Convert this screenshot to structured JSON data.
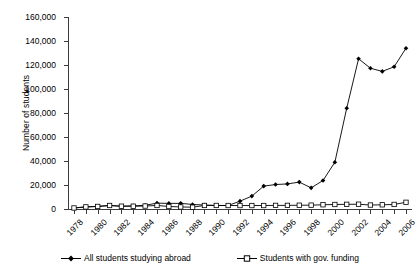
{
  "chart_data": {
    "type": "line",
    "title": "",
    "xlabel": "",
    "ylabel": "Number of students",
    "ylim": [
      0,
      160000
    ],
    "ytick_labels": [
      "0",
      "20,000",
      "40,000",
      "60,000",
      "80,000",
      "100,000",
      "120,000",
      "140,000",
      "160,000"
    ],
    "ytick_values": [
      0,
      20000,
      40000,
      60000,
      80000,
      100000,
      120000,
      140000,
      160000
    ],
    "grid": false,
    "legend_position": "bottom-center",
    "x": [
      1978,
      1979,
      1980,
      1981,
      1982,
      1983,
      1984,
      1985,
      1986,
      1987,
      1988,
      1989,
      1990,
      1991,
      1992,
      1993,
      1994,
      1995,
      1996,
      1997,
      1998,
      1999,
      2000,
      2001,
      2002,
      2003,
      2004,
      2005,
      2006
    ],
    "xtick_labels": [
      "1978",
      "1980",
      "1982",
      "1984",
      "1986",
      "1988",
      "1990",
      "1992",
      "1994",
      "1996",
      "1998",
      "2000",
      "2002",
      "2004",
      "2006"
    ],
    "xtick_values": [
      1978,
      1980,
      1982,
      1984,
      1986,
      1988,
      1990,
      1992,
      1994,
      1996,
      1998,
      2000,
      2002,
      2004,
      2006
    ],
    "series": [
      {
        "name": "All students studying abroad",
        "marker": "filled-diamond",
        "color": "#000000",
        "values": [
          860,
          1750,
          2124,
          2922,
          2326,
          2633,
          3073,
          4888,
          4676,
          4703,
          3786,
          3329,
          2950,
          2900,
          6540,
          10742,
          19071,
          20381,
          20905,
          22410,
          17622,
          23749,
          38989,
          83973,
          125179,
          117307,
          114682,
          118515,
          134000
        ]
      },
      {
        "name": "Students with gov. funding",
        "marker": "open-square",
        "color": "#000000",
        "values": [
          860,
          1750,
          2124,
          2922,
          2326,
          2328,
          2469,
          2950,
          2100,
          1700,
          1500,
          2950,
          2950,
          2900,
          2883,
          2881,
          2895,
          3000,
          3016,
          3148,
          3212,
          3536,
          3767,
          3900,
          3985,
          3300,
          3500,
          3800,
          5580
        ]
      }
    ]
  },
  "axis": {
    "y_title": "Number of students"
  },
  "legend": {
    "items": [
      {
        "label": "All students studying abroad",
        "marker": "filled-diamond-icon"
      },
      {
        "label": "Students with gov. funding",
        "marker": "open-square-icon"
      }
    ]
  }
}
